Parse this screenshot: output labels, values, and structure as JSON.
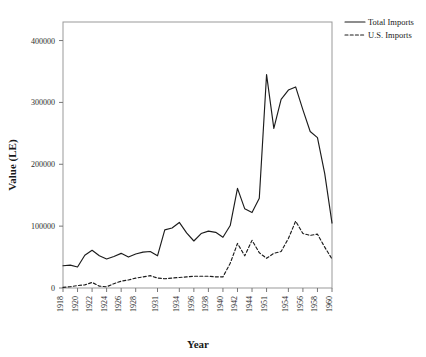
{
  "chart_data": {
    "type": "line",
    "title": "",
    "xlabel": "Year",
    "ylabel": "Value (LE)",
    "grid": false,
    "legend_position": "top-right",
    "ylim": [
      0,
      430000
    ],
    "yticks": [
      0,
      100000,
      200000,
      300000,
      400000
    ],
    "ytick_labels": [
      "0",
      "100000",
      "200000",
      "300000",
      "400000"
    ],
    "categories": [
      "1918",
      "1919",
      "1920",
      "1921",
      "1922",
      "1923",
      "1924",
      "1925",
      "1926",
      "1927",
      "1928",
      "1929",
      "1930",
      "1931",
      "1932",
      "1933",
      "1934",
      "1935",
      "1936",
      "1937",
      "1938",
      "1939",
      "1940",
      "1941",
      "1942",
      "1943",
      "1944",
      "1945",
      "1951",
      "1952",
      "1953",
      "1954",
      "1955",
      "1956",
      "1957",
      "1958",
      "1959",
      "1960"
    ],
    "xtick_labels": [
      "1918",
      "1920",
      "1922",
      "1924",
      "1926",
      "1928",
      "1931",
      "1934",
      "1936",
      "1938",
      "1940",
      "1942",
      "1944",
      "1951",
      "1954",
      "1956",
      "1958",
      "1960"
    ],
    "series": [
      {
        "name": "Total Imports",
        "style": "solid",
        "values": [
          36000,
          37000,
          34000,
          53000,
          61000,
          52000,
          47000,
          51000,
          56000,
          50000,
          55000,
          58000,
          59000,
          52000,
          94000,
          97000,
          106000,
          89000,
          76000,
          88000,
          92000,
          90000,
          82000,
          101000,
          161000,
          128000,
          122000,
          145000,
          345000,
          258000,
          305000,
          320000,
          325000,
          288000,
          253000,
          243000,
          185000,
          105000
        ]
      },
      {
        "name": "U.S. Imports",
        "style": "dashed",
        "values": [
          1000,
          2000,
          4000,
          5000,
          9000,
          3000,
          2000,
          7000,
          11000,
          13000,
          16000,
          18000,
          20000,
          16000,
          15000,
          16000,
          17000,
          18000,
          19000,
          19000,
          19000,
          18000,
          18000,
          40000,
          72000,
          52000,
          77000,
          57000,
          48000,
          56000,
          59000,
          80000,
          108000,
          88000,
          85000,
          87000,
          66000,
          47000
        ]
      }
    ]
  },
  "legend": {
    "items": [
      {
        "label": "Total Imports",
        "style": "solid"
      },
      {
        "label": "U.S. Imports",
        "style": "dashed"
      }
    ]
  }
}
